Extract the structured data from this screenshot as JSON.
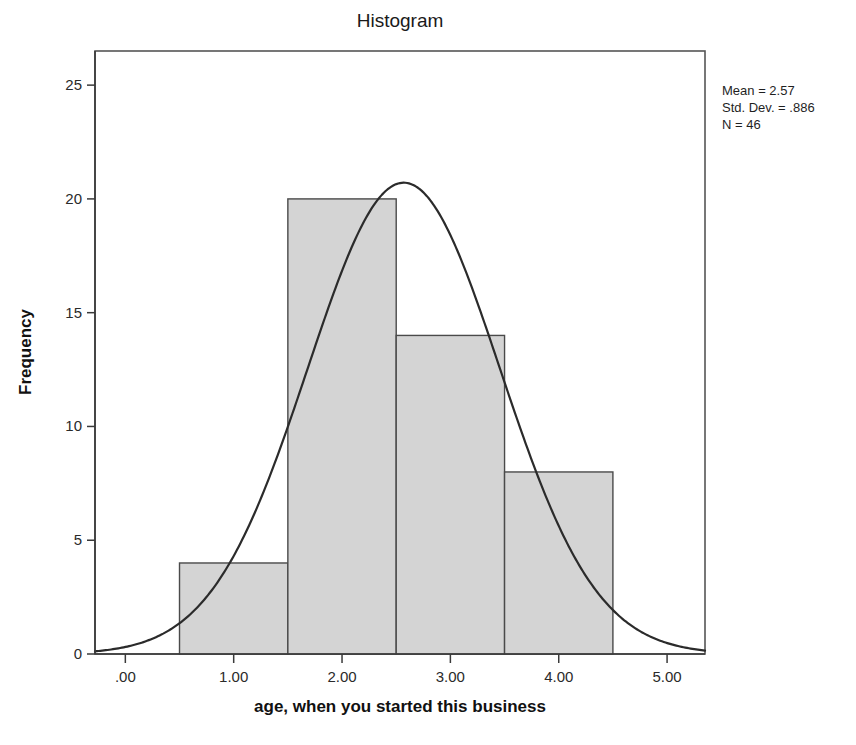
{
  "chart_data": {
    "type": "bar",
    "title": "Histogram",
    "xlabel": "age, when you started this business",
    "ylabel": "Frequency",
    "categories": [
      "0.50-1.50",
      "1.50-2.50",
      "2.50-3.50",
      "3.50-4.50"
    ],
    "bin_edges": [
      0.5,
      1.5,
      2.5,
      3.5,
      4.5
    ],
    "values": [
      4,
      20,
      14,
      8
    ],
    "xlim": [
      -0.28,
      5.35
    ],
    "ylim": [
      0,
      26.5
    ],
    "xticks": [
      0,
      1,
      2,
      3,
      4,
      5
    ],
    "xtick_labels": [
      ".00",
      "1.00",
      "2.00",
      "3.00",
      "4.00",
      "5.00"
    ],
    "yticks": [
      0,
      5,
      10,
      15,
      20,
      25
    ],
    "ytick_labels": [
      "0",
      "5",
      "10",
      "15",
      "20",
      "25"
    ],
    "grid": false,
    "legend": false,
    "overlay": {
      "type": "normal-curve",
      "mean": 2.57,
      "std_dev": 0.886,
      "n": 46,
      "bin_width": 1,
      "peak_value": 20.7
    },
    "annotations": {
      "position": "top-right-outside",
      "lines": [
        "Mean = 2.57",
        "Std. Dev. = .886",
        "N = 46"
      ],
      "mean_label": "Mean = 2.57",
      "std_dev_label": "Std. Dev. = .886",
      "n_label": "N = 46"
    }
  },
  "colors": {
    "bar_fill": "#d4d4d4",
    "bar_stroke": "#4a4a4a",
    "curve": "#2b2b2b",
    "axis": "#3a3a3a",
    "frame": "#555555",
    "background": "#ffffff"
  }
}
